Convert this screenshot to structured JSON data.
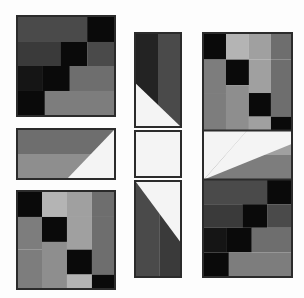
{
  "artwork": {
    "title": "Grayscale geometric quilt-block composition",
    "background_color": "#fdfdfd",
    "border_color": "#2b2b2b",
    "canvas": {
      "width": 304,
      "height": 298
    },
    "palette": {
      "black": "#0a0a0a",
      "near_black": "#151515",
      "very_dark_gray": "#232323",
      "dark_gray": "#3a3a3a",
      "mid_dark_gray": "#4a4a4a",
      "mid_gray": "#6e6e6e",
      "gray": "#7d7d7d",
      "light_mid_gray": "#8e8e8e",
      "light_gray": "#a0a0a0",
      "pale_gray": "#b4b4b4",
      "white": "#f4f4f4",
      "border": "#2b2b2b"
    }
  },
  "panels": [
    {
      "id": "panel-top-left",
      "name": "dark-grid-block-upper-left",
      "x": 16,
      "y": 15,
      "width": 100,
      "height": 102,
      "kind": "grid",
      "description": "Four-row irregular grid of dark grays and blacks",
      "cells": [
        {
          "x": 0,
          "y": 0,
          "w": 72,
          "h": 26,
          "color": "#4a4a4a"
        },
        {
          "x": 72,
          "y": 0,
          "w": 28,
          "h": 26,
          "color": "#0a0a0a"
        },
        {
          "x": 0,
          "y": 26,
          "w": 44,
          "h": 25,
          "color": "#3a3a3a"
        },
        {
          "x": 44,
          "y": 26,
          "w": 28,
          "h": 25,
          "color": "#0a0a0a"
        },
        {
          "x": 72,
          "y": 26,
          "w": 28,
          "h": 25,
          "color": "#4a4a4a"
        },
        {
          "x": 0,
          "y": 51,
          "w": 26,
          "h": 26,
          "color": "#151515"
        },
        {
          "x": 26,
          "y": 51,
          "w": 28,
          "h": 26,
          "color": "#0a0a0a"
        },
        {
          "x": 54,
          "y": 51,
          "w": 46,
          "h": 26,
          "color": "#6e6e6e"
        },
        {
          "x": 0,
          "y": 77,
          "w": 28,
          "h": 25,
          "color": "#0a0a0a"
        },
        {
          "x": 28,
          "y": 77,
          "w": 72,
          "h": 25,
          "color": "#7d7d7d"
        }
      ]
    },
    {
      "id": "panel-mid-left",
      "name": "diagonal-bar-block-middle-left",
      "x": 16,
      "y": 128,
      "width": 100,
      "height": 52,
      "kind": "diagonal",
      "description": "Horizontal two-tone bar with white triangle at right",
      "layers": [
        {
          "shape": "rect",
          "points": "0,0 100,0 100,26 0,26",
          "color": "#6e6e6e"
        },
        {
          "shape": "rect",
          "points": "0,26 100,26 100,52 0,52",
          "color": "#8e8e8e"
        },
        {
          "shape": "triangle",
          "points": "100,0 100,52 52,52",
          "color": "#f4f4f4"
        }
      ]
    },
    {
      "id": "panel-bottom-left",
      "name": "light-grid-block-lower-left",
      "x": 16,
      "y": 190,
      "width": 100,
      "height": 100,
      "kind": "grid",
      "description": "Irregular checkerboard of light grays and blacks",
      "cells": [
        {
          "x": 0,
          "y": 0,
          "w": 25,
          "h": 26,
          "color": "#0a0a0a"
        },
        {
          "x": 25,
          "y": 0,
          "w": 26,
          "h": 26,
          "color": "#b4b4b4"
        },
        {
          "x": 51,
          "y": 0,
          "w": 26,
          "h": 26,
          "color": "#a0a0a0"
        },
        {
          "x": 77,
          "y": 0,
          "w": 23,
          "h": 26,
          "color": "#6e6e6e"
        },
        {
          "x": 0,
          "y": 26,
          "w": 25,
          "h": 34,
          "color": "#7d7d7d"
        },
        {
          "x": 25,
          "y": 26,
          "w": 26,
          "h": 26,
          "color": "#0a0a0a"
        },
        {
          "x": 51,
          "y": 26,
          "w": 26,
          "h": 34,
          "color": "#a0a0a0"
        },
        {
          "x": 77,
          "y": 26,
          "w": 23,
          "h": 60,
          "color": "#6e6e6e"
        },
        {
          "x": 25,
          "y": 52,
          "w": 26,
          "h": 48,
          "color": "#8e8e8e"
        },
        {
          "x": 51,
          "y": 60,
          "w": 26,
          "h": 26,
          "color": "#0a0a0a"
        },
        {
          "x": 0,
          "y": 60,
          "w": 25,
          "h": 40,
          "color": "#7d7d7d"
        },
        {
          "x": 51,
          "y": 86,
          "w": 26,
          "h": 14,
          "color": "#b4b4b4"
        },
        {
          "x": 77,
          "y": 86,
          "w": 23,
          "h": 14,
          "color": "#0a0a0a"
        }
      ]
    },
    {
      "id": "panel-center-top",
      "name": "diagonal-block-center-top",
      "x": 134,
      "y": 32,
      "width": 48,
      "height": 96,
      "kind": "diagonal",
      "description": "Dark left column, gray right column, white triangle lower-left",
      "layers": [
        {
          "shape": "rect",
          "points": "0,0 24,0 24,96 0,96",
          "color": "#232323"
        },
        {
          "shape": "rect",
          "points": "24,0 48,0 48,96 24,96",
          "color": "#4a4a4a"
        },
        {
          "shape": "triangle",
          "points": "0,52 48,96 0,96",
          "color": "#f4f4f4"
        }
      ]
    },
    {
      "id": "panel-center-middle",
      "name": "white-block-center-middle",
      "x": 134,
      "y": 130,
      "width": 48,
      "height": 48,
      "kind": "diagonal",
      "description": "Solid white panel",
      "layers": [
        {
          "shape": "rect",
          "points": "0,0 48,0 48,48 0,48",
          "color": "#f4f4f4"
        }
      ]
    },
    {
      "id": "panel-center-bottom",
      "name": "diagonal-block-center-bottom",
      "x": 134,
      "y": 180,
      "width": 48,
      "height": 98,
      "kind": "diagonal",
      "description": "White triangle upper-right over dark gray columns",
      "layers": [
        {
          "shape": "rect",
          "points": "0,0 26,0 26,98 0,98",
          "color": "#4a4a4a"
        },
        {
          "shape": "rect",
          "points": "26,0 48,0 48,98 26,98",
          "color": "#3a3a3a"
        },
        {
          "shape": "triangle",
          "points": "0,0 48,0 48,62",
          "color": "#f4f4f4"
        }
      ]
    },
    {
      "id": "panel-right",
      "name": "tall-composite-block-right",
      "x": 202,
      "y": 32,
      "width": 91,
      "height": 246,
      "kind": "composite",
      "description": "Tall panel: light grid on top, diagonal bar in middle, dark grid at bottom",
      "sections": [
        {
          "name": "right-upper-grid",
          "offset_y": 0,
          "height": 98,
          "cells": [
            {
              "x": 0,
              "y": 0,
              "w": 23,
              "h": 26,
              "color": "#0a0a0a"
            },
            {
              "x": 23,
              "y": 0,
              "w": 24,
              "h": 26,
              "color": "#b4b4b4"
            },
            {
              "x": 47,
              "y": 0,
              "w": 23,
              "h": 26,
              "color": "#a0a0a0"
            },
            {
              "x": 70,
              "y": 0,
              "w": 21,
              "h": 26,
              "color": "#6e6e6e"
            },
            {
              "x": 0,
              "y": 26,
              "w": 23,
              "h": 34,
              "color": "#7d7d7d"
            },
            {
              "x": 23,
              "y": 26,
              "w": 24,
              "h": 26,
              "color": "#0a0a0a"
            },
            {
              "x": 47,
              "y": 26,
              "w": 23,
              "h": 34,
              "color": "#a0a0a0"
            },
            {
              "x": 70,
              "y": 26,
              "w": 21,
              "h": 58,
              "color": "#6e6e6e"
            },
            {
              "x": 23,
              "y": 52,
              "w": 24,
              "h": 46,
              "color": "#8e8e8e"
            },
            {
              "x": 47,
              "y": 60,
              "w": 23,
              "h": 24,
              "color": "#0a0a0a"
            },
            {
              "x": 0,
              "y": 60,
              "w": 23,
              "h": 38,
              "color": "#7d7d7d"
            },
            {
              "x": 47,
              "y": 84,
              "w": 23,
              "h": 14,
              "color": "#a0a0a0"
            },
            {
              "x": 70,
              "y": 84,
              "w": 21,
              "h": 14,
              "color": "#0a0a0a"
            }
          ]
        },
        {
          "name": "right-middle-diagonal",
          "offset_y": 98,
          "height": 50,
          "layers": [
            {
              "shape": "rect",
              "points": "0,0 91,0 91,25 0,25",
              "color": "#a0a0a0"
            },
            {
              "shape": "rect",
              "points": "0,25 91,25 91,50 0,50",
              "color": "#7d7d7d"
            },
            {
              "shape": "triangle",
              "points": "0,0 0,50 45,0",
              "color": "#f4f4f4"
            },
            {
              "shape": "triangle",
              "points": "0,50 45,0 91,0 91,14",
              "color": "#f4f4f4"
            }
          ]
        },
        {
          "name": "right-lower-grid",
          "offset_y": 148,
          "height": 98,
          "cells": [
            {
              "x": 0,
              "y": 0,
              "w": 66,
              "h": 25,
              "color": "#4a4a4a"
            },
            {
              "x": 66,
              "y": 0,
              "w": 25,
              "h": 25,
              "color": "#0a0a0a"
            },
            {
              "x": 0,
              "y": 25,
              "w": 40,
              "h": 24,
              "color": "#3a3a3a"
            },
            {
              "x": 40,
              "y": 25,
              "w": 26,
              "h": 24,
              "color": "#0a0a0a"
            },
            {
              "x": 66,
              "y": 25,
              "w": 25,
              "h": 24,
              "color": "#4a4a4a"
            },
            {
              "x": 0,
              "y": 49,
              "w": 24,
              "h": 25,
              "color": "#151515"
            },
            {
              "x": 24,
              "y": 49,
              "w": 26,
              "h": 25,
              "color": "#0a0a0a"
            },
            {
              "x": 50,
              "y": 49,
              "w": 41,
              "h": 25,
              "color": "#6e6e6e"
            },
            {
              "x": 0,
              "y": 74,
              "w": 26,
              "h": 24,
              "color": "#0a0a0a"
            },
            {
              "x": 26,
              "y": 74,
              "w": 65,
              "h": 24,
              "color": "#7d7d7d"
            }
          ]
        }
      ]
    }
  ]
}
